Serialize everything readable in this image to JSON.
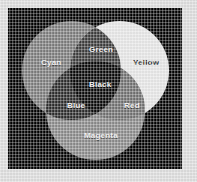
{
  "figure": {
    "kind": "venn-diagram",
    "panel_background": "#000000",
    "page_background": "#dddddd",
    "rendering": "grayscale"
  },
  "labels": {
    "cyan": "Cyan",
    "yellow": "Yellow",
    "magenta": "Magenta",
    "green": "Green",
    "red": "Red",
    "blue": "Blue",
    "black": "Black"
  },
  "chart_data": {
    "type": "venn",
    "sets": [
      {
        "name": "Cyan",
        "label": "Cyan",
        "fill": "#7c7c7c",
        "cx": 63,
        "cy": 62,
        "r": 49
      },
      {
        "name": "Yellow",
        "label": "Yellow",
        "fill": "#ebebeb",
        "cx": 111,
        "cy": 62,
        "r": 49
      },
      {
        "name": "Magenta",
        "label": "Magenta",
        "fill": "#8a8a8a",
        "cx": 87,
        "cy": 102,
        "r": 49
      }
    ],
    "intersections": [
      {
        "sets": [
          "Cyan",
          "Yellow"
        ],
        "label": "Green",
        "fill": "#3b3b3b"
      },
      {
        "sets": [
          "Yellow",
          "Magenta"
        ],
        "label": "Red",
        "fill": "#717171"
      },
      {
        "sets": [
          "Cyan",
          "Magenta"
        ],
        "label": "Blue",
        "fill": "#2b2b2b"
      },
      {
        "sets": [
          "Cyan",
          "Yellow",
          "Magenta"
        ],
        "label": "Black",
        "fill": "#070707"
      }
    ],
    "legend": "none",
    "grid": false
  }
}
